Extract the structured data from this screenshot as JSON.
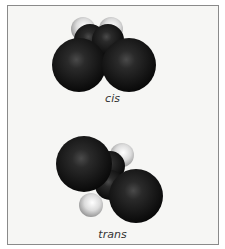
{
  "figure": {
    "molecules": [
      {
        "label": "cis",
        "atoms": [
          {
            "element": "H",
            "cx": 83,
            "cy": 29,
            "r": 12
          },
          {
            "element": "H",
            "cx": 111,
            "cy": 29,
            "r": 12
          },
          {
            "element": "C",
            "cx": 90,
            "cy": 40,
            "r": 16
          },
          {
            "element": "C",
            "cx": 108,
            "cy": 40,
            "r": 16
          },
          {
            "element": "Cl",
            "cx": 79,
            "cy": 65,
            "r": 27
          },
          {
            "element": "Cl",
            "cx": 129,
            "cy": 65,
            "r": 27
          }
        ]
      },
      {
        "label": "trans",
        "atoms": [
          {
            "element": "H",
            "cx": 122,
            "cy": 155,
            "r": 12
          },
          {
            "element": "H",
            "cx": 91,
            "cy": 205,
            "r": 12
          },
          {
            "element": "C",
            "cx": 110,
            "cy": 166,
            "r": 15
          },
          {
            "element": "C",
            "cx": 110,
            "cy": 185,
            "r": 15
          },
          {
            "element": "Cl",
            "cx": 84,
            "cy": 164,
            "r": 28
          },
          {
            "element": "Cl",
            "cx": 136,
            "cy": 196,
            "r": 27
          }
        ]
      }
    ],
    "colors": {
      "background": "#f6f6f4",
      "border": "#8a8a8a",
      "dark_atom": "#1a1a1a",
      "light_atom": "#e6e6e6"
    }
  }
}
